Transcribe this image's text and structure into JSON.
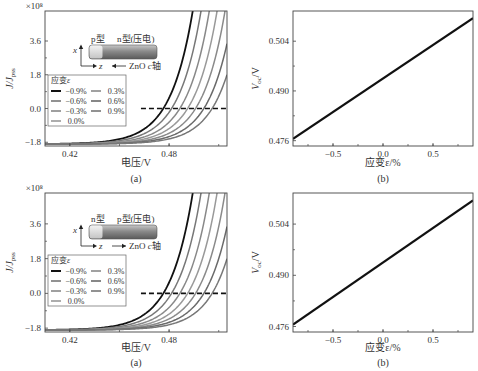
{
  "chart_data": [
    {
      "id": "top-a",
      "type": "line",
      "panel_label": "(a)",
      "title": "",
      "xlabel": "电压/V",
      "ylabel": "J/J_pss",
      "y_multiplier": "×10⁸",
      "xlim": [
        0.405,
        0.515
      ],
      "ylim": [
        -2.0,
        5.2
      ],
      "xticks": [
        0.42,
        0.48
      ],
      "xtick_labels": [
        "0.42",
        "0.48"
      ],
      "yticks": [
        -1.8,
        0.0,
        1.8,
        3.6
      ],
      "ytick_labels": [
        "-1.8",
        "0.0",
        "1.8",
        "3.6"
      ],
      "legend": {
        "title": "应变ε",
        "position": "center-left",
        "entries": [
          "-0.9%",
          "-0.6%",
          "-0.3%",
          "0.0%",
          "0.3%",
          "0.6%",
          "0.9%"
        ]
      },
      "series": [
        {
          "name": "-0.9%",
          "color": "#111111",
          "Voc": 0.4765
        },
        {
          "name": "-0.6%",
          "color": "#777777",
          "Voc": 0.4815
        },
        {
          "name": "-0.3%",
          "color": "#888888",
          "Voc": 0.4865
        },
        {
          "name": "0.0%",
          "color": "#999999",
          "Voc": 0.4912
        },
        {
          "name": "0.3%",
          "color": "#8a8a8a",
          "Voc": 0.496
        },
        {
          "name": "0.6%",
          "color": "#6a6a6a",
          "Voc": 0.501
        },
        {
          "name": "0.9%",
          "color": "#777777",
          "Voc": 0.506
        }
      ],
      "reference_line": {
        "y": 0.0,
        "x_start": 0.463,
        "style": "dashed"
      },
      "inset": {
        "left_label": "p型",
        "right_label": "n型(压电)",
        "axis_x": "x",
        "axis_z": "z",
        "caxis_label": "ZnO c轴",
        "caxis_direction": "left"
      }
    },
    {
      "id": "top-b",
      "type": "line",
      "panel_label": "(b)",
      "title": "",
      "xlabel": "应变ε/%",
      "ylabel": "V_oc/V",
      "xlim": [
        -0.9,
        0.9
      ],
      "ylim": [
        0.4745,
        0.5125
      ],
      "xticks": [
        -0.5,
        0.0,
        0.5
      ],
      "xtick_labels": [
        "-0.5",
        "0.0",
        "0.5"
      ],
      "yticks": [
        0.476,
        0.49,
        0.504
      ],
      "ytick_labels": [
        "0.476",
        "0.490",
        "0.504"
      ],
      "series": [
        {
          "name": "Voc",
          "color": "#111111",
          "x": [
            -0.9,
            0.9
          ],
          "y": [
            0.4765,
            0.5105
          ]
        }
      ]
    },
    {
      "id": "bottom-a",
      "type": "line",
      "panel_label": "(a)",
      "title": "",
      "xlabel": "电压/V",
      "ylabel": "J/J_pss",
      "y_multiplier": "×10⁸",
      "xlim": [
        0.405,
        0.515
      ],
      "ylim": [
        -2.0,
        5.2
      ],
      "xticks": [
        0.42,
        0.48
      ],
      "xtick_labels": [
        "0.42",
        "0.48"
      ],
      "yticks": [
        -1.8,
        0.0,
        1.8,
        3.6
      ],
      "ytick_labels": [
        "-1.8",
        "0.0",
        "1.8",
        "3.6"
      ],
      "legend": {
        "title": "应变ε",
        "position": "center-left",
        "entries": [
          "-0.9%",
          "-0.6%",
          "-0.3%",
          "0.0%",
          "0.3%",
          "0.6%",
          "0.9%"
        ]
      },
      "series": [
        {
          "name": "-0.9%",
          "color": "#111111",
          "Voc": 0.4765
        },
        {
          "name": "-0.6%",
          "color": "#777777",
          "Voc": 0.4815
        },
        {
          "name": "-0.3%",
          "color": "#888888",
          "Voc": 0.4865
        },
        {
          "name": "0.0%",
          "color": "#999999",
          "Voc": 0.4912
        },
        {
          "name": "0.3%",
          "color": "#8a8a8a",
          "Voc": 0.496
        },
        {
          "name": "0.6%",
          "color": "#6a6a6a",
          "Voc": 0.501
        },
        {
          "name": "0.9%",
          "color": "#777777",
          "Voc": 0.506
        }
      ],
      "reference_line": {
        "y": 0.0,
        "x_start": 0.463,
        "style": "dashed"
      },
      "inset": {
        "left_label": "n型",
        "right_label": "p型(压电)",
        "axis_x": "x",
        "axis_z": "z",
        "caxis_label": "ZnO c轴",
        "caxis_direction": "right"
      }
    },
    {
      "id": "bottom-b",
      "type": "line",
      "panel_label": "(b)",
      "title": "",
      "xlabel": "应变ε/%",
      "ylabel": "V_oc/V",
      "xlim": [
        -0.9,
        0.9
      ],
      "ylim": [
        0.4745,
        0.5125
      ],
      "xticks": [
        -0.5,
        0.0,
        0.5
      ],
      "xtick_labels": [
        "-0.5",
        "0.0",
        "0.5"
      ],
      "yticks": [
        0.476,
        0.49,
        0.504
      ],
      "ytick_labels": [
        "0.476",
        "0.490",
        "0.504"
      ],
      "series": [
        {
          "name": "Voc",
          "color": "#111111",
          "x": [
            -0.9,
            0.9
          ],
          "y": [
            0.4765,
            0.5105
          ]
        }
      ]
    }
  ]
}
